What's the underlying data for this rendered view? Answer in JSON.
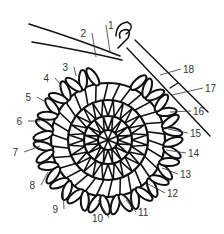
{
  "diagram": {
    "title": "",
    "labels": [
      "1",
      "2",
      "3",
      "4",
      "5",
      "6",
      "7",
      "8",
      "9",
      "10",
      "11",
      "12",
      "13",
      "14",
      "15",
      "16",
      "17",
      "18"
    ],
    "colors": {
      "ink": "#111111",
      "label": "#333333",
      "background": "#ffffff"
    }
  }
}
